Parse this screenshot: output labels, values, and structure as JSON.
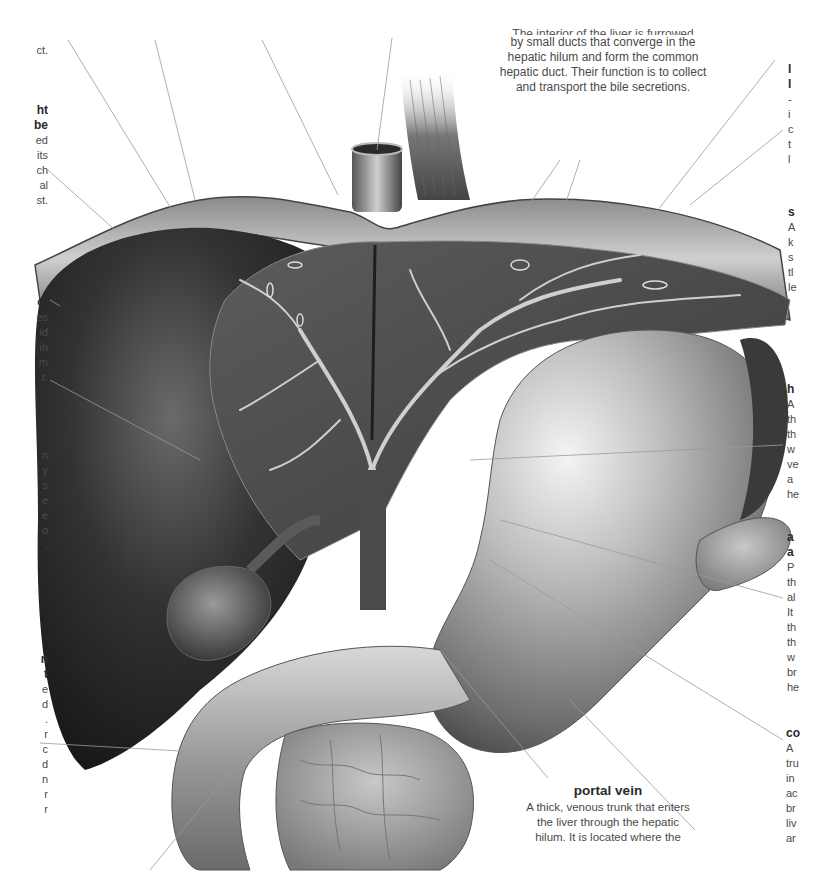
{
  "figure": {
    "colors": {
      "background": "#ffffff",
      "liver_dark": "#2b2b2b",
      "liver_mid": "#555555",
      "stomach_light": "#dcdcdc",
      "text": "#4a4a4a",
      "heading_text": "#2a2a2a",
      "leader_line": "#9a9a9a"
    }
  },
  "labels": {
    "top_center": {
      "cut_line": "The interior of the liver is furrowed",
      "lines": [
        "by small ducts that converge in the",
        "hepatic hilum and form the common",
        "hepatic duct. Their function is to collect",
        "and transport the bile secretions."
      ]
    },
    "portal_vein": {
      "title": "portal vein",
      "lines": [
        "A thick, venous trunk that enters",
        "the liver through the hepatic",
        "hilum. It is located where the"
      ]
    },
    "left_fragments": [
      {
        "title": [],
        "lines": [
          "ct."
        ]
      },
      {
        "title": [
          "ht",
          "be"
        ],
        "lines": [
          "ed",
          "its",
          "ch",
          "al",
          "st."
        ]
      },
      {
        "title": [
          "ct"
        ],
        "lines": [
          "es",
          "id",
          "in",
          "m",
          "t."
        ]
      },
      {
        "title": [
          "r"
        ],
        "lines": [
          "n",
          "y",
          "s",
          "e",
          "e",
          "o",
          "."
        ]
      },
      {
        "title": [
          "n",
          "t"
        ],
        "lines": [
          "e",
          "d",
          ".",
          "r",
          "c",
          "d",
          "n",
          "r",
          "r",
          "."
        ]
      }
    ],
    "right_fragments": [
      {
        "title": [
          "l",
          "l"
        ],
        "lines": [
          "-",
          "i",
          "c",
          "t",
          "l"
        ]
      },
      {
        "title": [
          "s"
        ],
        "lines": [
          "A",
          "k",
          "s",
          "tl",
          "le"
        ]
      },
      {
        "title": [
          "h"
        ],
        "lines": [
          "A",
          "th",
          "th",
          "w",
          "ve",
          "a",
          "he"
        ]
      },
      {
        "title": [
          "a",
          "a"
        ],
        "lines": [
          "P",
          "th",
          "al",
          "It",
          "th",
          "th",
          "w",
          "br",
          "he"
        ]
      },
      {
        "title": [
          "co"
        ],
        "lines": [
          "A",
          "tru",
          "in",
          "ac",
          "br",
          "liv",
          "ar"
        ]
      }
    ]
  }
}
